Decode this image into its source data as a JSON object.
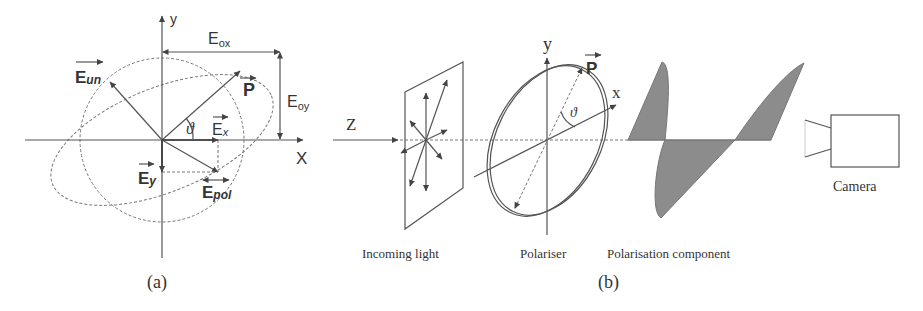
{
  "panel_a": {
    "caption": "(a)",
    "axis_y_label": "y",
    "axis_x_label": "X",
    "labels": {
      "E_ox": "E",
      "E_ox_sub": "ox",
      "E_oy": "E",
      "E_oy_sub": "oy",
      "E_un": "E",
      "E_un_sub": "un",
      "P": "P",
      "E_x": "E",
      "E_x_sub": "x",
      "E_y": "E",
      "E_y_sub": "y",
      "E_pol": "E",
      "E_pol_sub": "pol",
      "theta": "ϑ"
    }
  },
  "panel_b": {
    "caption": "(b)",
    "z_label": "Z",
    "y_label": "y",
    "x_label": "x",
    "P_label": "P",
    "theta": "ϑ",
    "stage_labels": {
      "incoming_light": "Incoming light",
      "polariser": "Polariser",
      "polarisation_component": "Polarisation component",
      "camera": "Camera"
    }
  },
  "colors": {
    "line": "#555555",
    "wave_fill": "#8c8c8c",
    "text": "#333333"
  }
}
